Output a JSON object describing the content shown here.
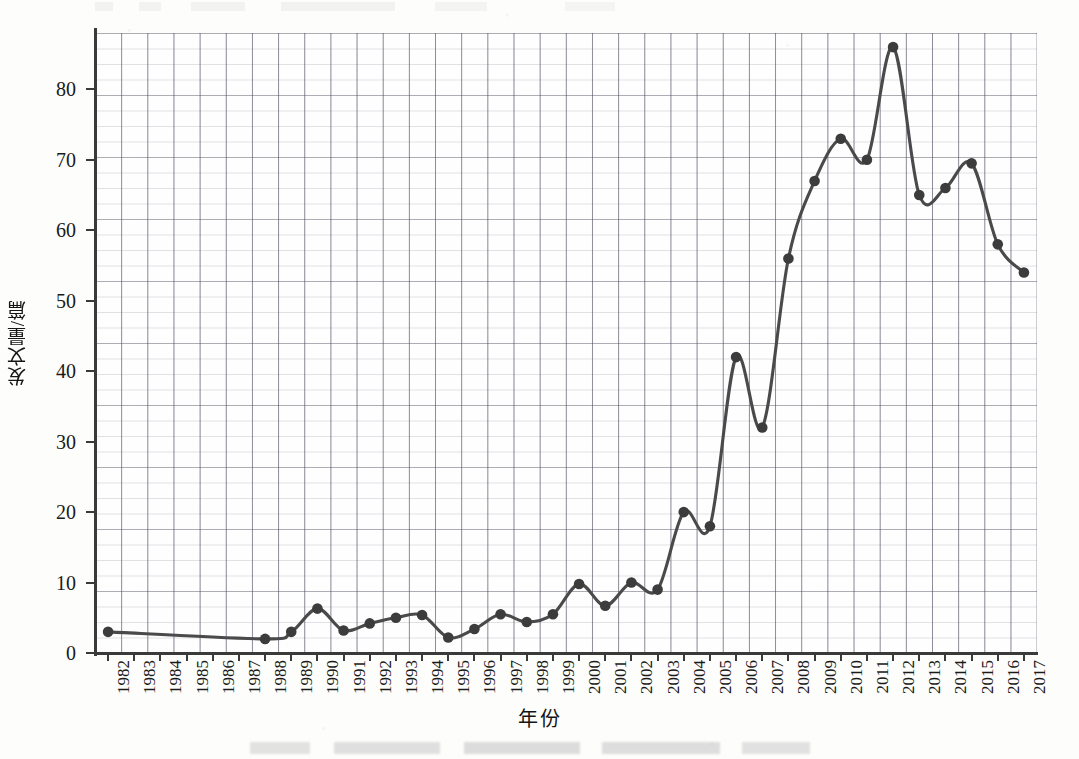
{
  "chart_data": {
    "type": "line",
    "title": "",
    "xlabel": "年份",
    "ylabel": "发文量/篇",
    "xlim": [
      1981.5,
      2017.5
    ],
    "ylim": [
      0,
      88
    ],
    "yticks": [
      0,
      10,
      20,
      30,
      40,
      50,
      60,
      70,
      80
    ],
    "grid": true,
    "legend": "none",
    "marker": "filled-circle",
    "line_color": "#4a4a4a",
    "marker_color": "#3c3c3c",
    "categories": [
      "1982",
      "1983",
      "1984",
      "1985",
      "1986",
      "1987",
      "1988",
      "1989",
      "1990",
      "1991",
      "1992",
      "1993",
      "1994",
      "1995",
      "1996",
      "1997",
      "1998",
      "1999",
      "2000",
      "2001",
      "2002",
      "2003",
      "2004",
      "2005",
      "2006",
      "2007",
      "2008",
      "2009",
      "2010",
      "2011",
      "2012",
      "2013",
      "2014",
      "2015",
      "2016",
      "2017"
    ],
    "values": [
      3,
      null,
      null,
      null,
      null,
      null,
      2,
      3,
      6.3,
      3.2,
      4.2,
      5,
      5.4,
      2.2,
      3.4,
      5.5,
      4.4,
      5.5,
      9.8,
      6.7,
      10,
      9,
      20,
      18,
      42,
      32,
      56,
      67,
      73,
      70,
      86,
      65,
      66,
      69.5,
      58,
      54
    ],
    "marker_years": [
      "1982",
      "1988",
      "1989",
      "1990",
      "1991",
      "1992",
      "1993",
      "1994",
      "1995",
      "1996",
      "1997",
      "1998",
      "1999",
      "2000",
      "2001",
      "2002",
      "2003",
      "2004",
      "2005",
      "2006",
      "2007",
      "2008",
      "2009",
      "2010",
      "2011",
      "2012",
      "2013",
      "2014",
      "2015",
      "2016",
      "2017"
    ]
  },
  "figure": {
    "y_axis_title": "发文量/篇",
    "x_axis_title": "年份"
  }
}
